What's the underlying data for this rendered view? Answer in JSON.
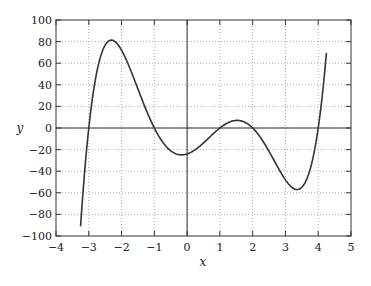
{
  "chart_data": {
    "type": "line",
    "title": "",
    "xlabel": "x",
    "ylabel": "y",
    "xlim": [
      -4,
      5
    ],
    "ylim": [
      -100,
      100
    ],
    "xticks": [
      -4,
      -3,
      -2,
      -1,
      0,
      1,
      2,
      3,
      4,
      5
    ],
    "yticks": [
      -100,
      -80,
      -60,
      -40,
      -20,
      0,
      20,
      40,
      60,
      80,
      100
    ],
    "grid": true,
    "legend": null,
    "series": [
      {
        "name": "y = (x+3)(x+1)(x-1)(x-2)(x-4)",
        "x_range": [
          -3.25,
          4.25
        ],
        "roots": [
          -3,
          -1,
          1,
          2,
          4
        ],
        "points": [
          [
            -3.25,
            -91
          ],
          [
            -3.0,
            0
          ],
          [
            -2.8,
            33
          ],
          [
            -2.5,
            74
          ],
          [
            -2.3,
            81
          ],
          [
            -2.0,
            72
          ],
          [
            -1.5,
            40
          ],
          [
            -1.0,
            0
          ],
          [
            -0.5,
            -20
          ],
          [
            0.0,
            -24
          ],
          [
            0.5,
            -13
          ],
          [
            1.0,
            0
          ],
          [
            1.5,
            7
          ],
          [
            2.0,
            0
          ],
          [
            2.5,
            -19
          ],
          [
            3.0,
            -48
          ],
          [
            3.4,
            -57
          ],
          [
            3.7,
            -42
          ],
          [
            4.0,
            0
          ],
          [
            4.25,
            70
          ]
        ],
        "color": "#333333"
      }
    ]
  },
  "axes": {
    "x_label": "x",
    "y_label": "y"
  }
}
